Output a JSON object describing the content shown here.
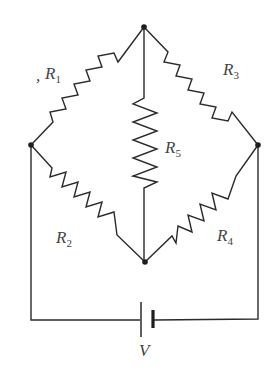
{
  "diagram": {
    "type": "wheatstone-bridge-circuit",
    "nodes": {
      "top": {
        "x": 144,
        "y": 27
      },
      "left": {
        "x": 31,
        "y": 145
      },
      "right": {
        "x": 258,
        "y": 145
      },
      "bottom": {
        "x": 145,
        "y": 262
      }
    },
    "resistors": [
      {
        "id": "R1",
        "letter": "R",
        "sub": "1",
        "between": [
          "left",
          "top"
        ]
      },
      {
        "id": "R2",
        "letter": "R",
        "sub": "2",
        "between": [
          "left",
          "bottom"
        ]
      },
      {
        "id": "R3",
        "letter": "R",
        "sub": "3",
        "between": [
          "top",
          "right"
        ]
      },
      {
        "id": "R4",
        "letter": "R",
        "sub": "4",
        "between": [
          "bottom",
          "right"
        ]
      },
      {
        "id": "R5",
        "letter": "R",
        "sub": "5",
        "between": [
          "top",
          "bottom"
        ]
      }
    ],
    "battery": {
      "label": "V",
      "between": [
        "left",
        "right"
      ]
    },
    "colors": {
      "line": "#2a2a2a",
      "text": "#444444",
      "background": "#ffffff"
    }
  }
}
